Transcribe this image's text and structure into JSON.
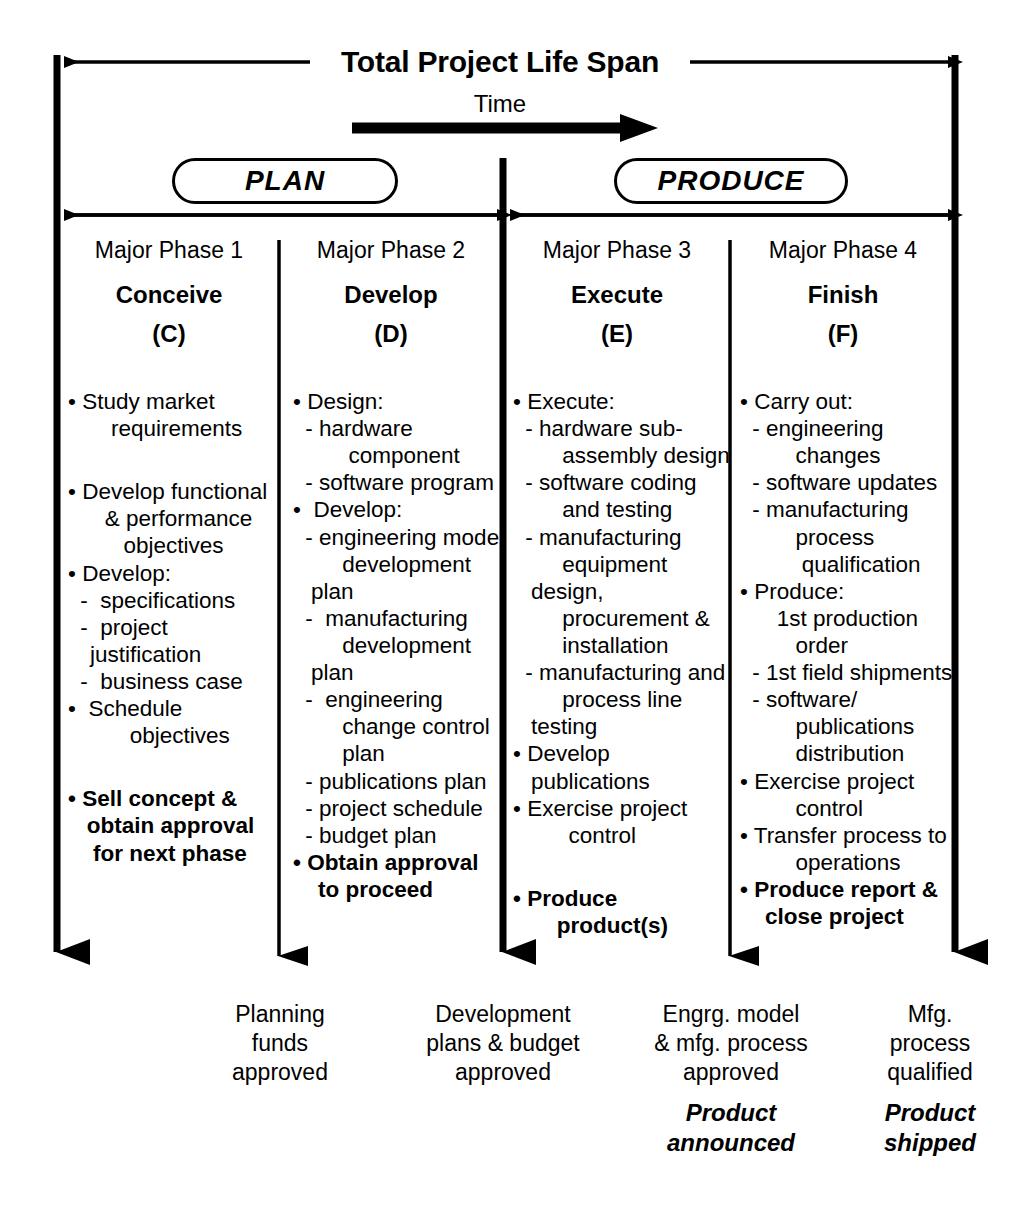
{
  "diagram": {
    "title": "Total Project Life Span",
    "time_label": "Time",
    "bands": [
      {
        "label": "PLAN"
      },
      {
        "label": "PRODUCE"
      }
    ],
    "columns": [
      {
        "major": "Major\nPhase 1",
        "name": "Conceive",
        "code": "(C)",
        "items": [
          {
            "style": "bullet",
            "text": "• Study market"
          },
          {
            "style": "plain",
            "text": "    requirements"
          },
          {
            "style": "gap",
            "text": ""
          },
          {
            "style": "bullet",
            "text": "• Develop functional"
          },
          {
            "style": "plain",
            "text": "   & performance"
          },
          {
            "style": "plain",
            "text": "      objectives"
          },
          {
            "style": "bullet",
            "text": "• Develop:"
          },
          {
            "style": "dash",
            "text": " -  specifications"
          },
          {
            "style": "dash",
            "text": " -  project justification"
          },
          {
            "style": "dash",
            "text": " -  business case"
          },
          {
            "style": "bullet",
            "text": "•  Schedule"
          },
          {
            "style": "plain",
            "text": "       objectives"
          },
          {
            "style": "gap",
            "text": ""
          },
          {
            "style": "bold",
            "text": "• Sell concept &"
          },
          {
            "style": "bold",
            "text": "   obtain approval"
          },
          {
            "style": "bold",
            "text": "    for next phase"
          }
        ],
        "outcome": "Planning\nfunds\napproved",
        "outcome_emph": ""
      },
      {
        "major": "Major\nPhase 2",
        "name": "Develop",
        "code": "(D)",
        "items": [
          {
            "style": "bullet",
            "text": "• Design:"
          },
          {
            "style": "dash",
            "text": " - hardware"
          },
          {
            "style": "plain",
            "text": "      component"
          },
          {
            "style": "dash",
            "text": " - software program"
          },
          {
            "style": "bullet",
            "text": "•  Develop:"
          },
          {
            "style": "dash",
            "text": " - engineering model"
          },
          {
            "style": "plain",
            "text": "     development plan"
          },
          {
            "style": "dash",
            "text": " -  manufacturing"
          },
          {
            "style": "plain",
            "text": "     development plan"
          },
          {
            "style": "dash",
            "text": " -  engineering"
          },
          {
            "style": "plain",
            "text": "     change control"
          },
          {
            "style": "plain",
            "text": "     plan"
          },
          {
            "style": "dash",
            "text": " - publications plan"
          },
          {
            "style": "dash",
            "text": " - project schedule"
          },
          {
            "style": "dash",
            "text": " - budget plan"
          },
          {
            "style": "bold",
            "text": "• Obtain approval"
          },
          {
            "style": "bold",
            "text": "    to proceed"
          }
        ],
        "outcome": "Development\nplans & budget\napproved",
        "outcome_emph": ""
      },
      {
        "major": "Major\nPhase 3",
        "name": "Execute",
        "code": "(E)",
        "items": [
          {
            "style": "bullet",
            "text": "• Execute:"
          },
          {
            "style": "dash",
            "text": " - hardware sub-"
          },
          {
            "style": "plain",
            "text": "     assembly design"
          },
          {
            "style": "dash",
            "text": " - software coding"
          },
          {
            "style": "plain",
            "text": "     and testing"
          },
          {
            "style": "dash",
            "text": " - manufacturing"
          },
          {
            "style": "plain",
            "text": "     equipment design,"
          },
          {
            "style": "plain",
            "text": "     procurement &"
          },
          {
            "style": "plain",
            "text": "     installation"
          },
          {
            "style": "dash",
            "text": " - manufacturing and"
          },
          {
            "style": "plain",
            "text": "     process line testing"
          },
          {
            "style": "bullet",
            "text": "• Develop publications"
          },
          {
            "style": "bullet",
            "text": "• Exercise project"
          },
          {
            "style": "plain",
            "text": "      control"
          },
          {
            "style": "gap",
            "text": ""
          },
          {
            "style": "bold",
            "text": "• Produce"
          },
          {
            "style": "bold",
            "text": "       product(s)"
          }
        ],
        "outcome": "Engrg. model\n& mfg. process\napproved",
        "outcome_emph": "Product\nannounced"
      },
      {
        "major": "Major\nPhase 4",
        "name": "Finish",
        "code": "(F)",
        "items": [
          {
            "style": "bullet",
            "text": "• Carry out:"
          },
          {
            "style": "dash",
            "text": " - engineering"
          },
          {
            "style": "plain",
            "text": "      changes"
          },
          {
            "style": "dash",
            "text": " - software updates"
          },
          {
            "style": "dash",
            "text": " - manufacturing"
          },
          {
            "style": "plain",
            "text": "      process"
          },
          {
            "style": "plain",
            "text": "       qualification"
          },
          {
            "style": "bullet",
            "text": "• Produce:"
          },
          {
            "style": "plain",
            "text": "   1st production"
          },
          {
            "style": "plain",
            "text": "      order"
          },
          {
            "style": "dash",
            "text": " - 1st field shipments"
          },
          {
            "style": "dash",
            "text": " - software/"
          },
          {
            "style": "plain",
            "text": "      publications"
          },
          {
            "style": "plain",
            "text": "      distribution"
          },
          {
            "style": "bullet",
            "text": "• Exercise project"
          },
          {
            "style": "plain",
            "text": "      control"
          },
          {
            "style": "bullet",
            "text": "• Transfer process to"
          },
          {
            "style": "plain",
            "text": "      operations"
          },
          {
            "style": "bold",
            "text": "• Produce report &"
          },
          {
            "style": "bold",
            "text": "    close project"
          }
        ],
        "outcome": "Mfg.\nprocess\nqualified",
        "outcome_emph": "Product\nshipped"
      }
    ],
    "colors": {
      "ink": "#000000",
      "background": "#ffffff"
    }
  }
}
